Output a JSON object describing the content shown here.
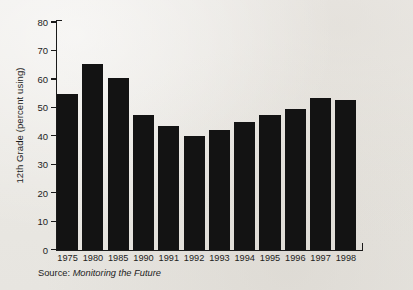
{
  "chart_data": {
    "type": "bar",
    "title": "",
    "xlabel": "",
    "ylabel": "12th Grade (percent using)",
    "categories": [
      "1975",
      "1980",
      "1985",
      "1990",
      "1991",
      "1992",
      "1993",
      "1994",
      "1995",
      "1996",
      "1997",
      "1998"
    ],
    "values": [
      55,
      65.3,
      60.5,
      47.3,
      43.5,
      40.2,
      42.3,
      44.9,
      47.6,
      49.7,
      53.4,
      52.9
    ],
    "ylim": [
      0,
      80
    ],
    "ytick_labels": [
      "0",
      "10",
      "20",
      "30",
      "40",
      "50",
      "60",
      "70",
      "80"
    ],
    "ytick_values": [
      0,
      10,
      20,
      30,
      40,
      50,
      60,
      70,
      80
    ],
    "grid": false,
    "legend": false,
    "bar_color": "#131313",
    "axis_color": "#1a1a1a",
    "background_color": "#eceae6"
  },
  "source_note": {
    "label": "Source: ",
    "title": "Monitoring the Future"
  }
}
